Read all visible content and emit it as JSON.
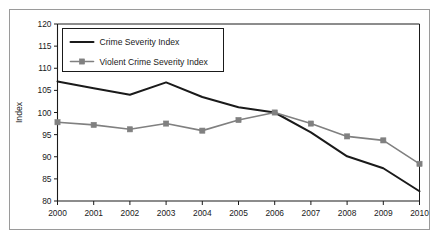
{
  "figure": {
    "frame_color": "#9a9a9a",
    "background": "#ffffff"
  },
  "axis": {
    "y_title": "Index",
    "y_ticks": [
      "120",
      "115",
      "110",
      "105",
      "100",
      "95",
      "90",
      "85",
      "80"
    ],
    "x_ticks": [
      "2000",
      "2001",
      "2002",
      "2003",
      "2004",
      "2005",
      "2006",
      "2007",
      "2008",
      "2009",
      "2010"
    ]
  },
  "legend": {
    "entries": [
      {
        "label": "Crime Severity Index",
        "color": "#1a1a1a",
        "marker": "none"
      },
      {
        "label": "Violent Crime Severity Index",
        "color": "#808080",
        "marker": "square"
      }
    ]
  },
  "chart_data": {
    "type": "line",
    "title": "",
    "xlabel": "",
    "ylabel": "Index",
    "x": [
      2000,
      2001,
      2002,
      2003,
      2004,
      2005,
      2006,
      2007,
      2008,
      2009,
      2010
    ],
    "categories": [
      "2000",
      "2001",
      "2002",
      "2003",
      "2004",
      "2005",
      "2006",
      "2007",
      "2008",
      "2009",
      "2010"
    ],
    "xlim": [
      2000,
      2010
    ],
    "ylim": [
      80,
      120
    ],
    "ytick_step": 5,
    "grid": false,
    "legend_position": "upper-left-inside",
    "series": [
      {
        "name": "Crime Severity Index",
        "color": "#1a1a1a",
        "marker": "none",
        "line_width": 2.0,
        "values": [
          107.0,
          105.5,
          104.0,
          106.8,
          103.5,
          101.2,
          100.0,
          95.5,
          90.1,
          87.4,
          82.2
        ]
      },
      {
        "name": "Violent Crime Severity Index",
        "color": "#808080",
        "marker": "square",
        "line_width": 1.6,
        "values": [
          97.8,
          97.2,
          96.2,
          97.5,
          95.9,
          98.3,
          100.0,
          97.5,
          94.6,
          93.7,
          88.4
        ]
      }
    ]
  }
}
